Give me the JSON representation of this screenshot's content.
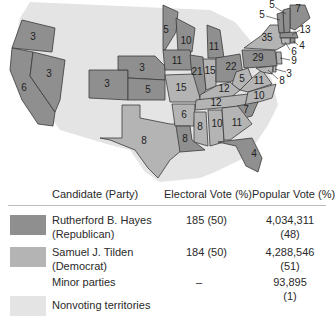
{
  "colors": {
    "republican": "#8f8f8f",
    "democrat": "#b4b4b4",
    "minor": "#ffffff",
    "nonvoting": "#e4e4e4",
    "border": "#3a3a3a"
  },
  "map": {
    "states": [
      {
        "id": "OR",
        "ev": "3",
        "party": "republican"
      },
      {
        "id": "CA",
        "ev": "6",
        "party": "republican"
      },
      {
        "id": "NV",
        "ev": "3",
        "party": "republican"
      },
      {
        "id": "CO",
        "ev": "3",
        "party": "republican"
      },
      {
        "id": "NE",
        "ev": "3",
        "party": "republican"
      },
      {
        "id": "KS",
        "ev": "5",
        "party": "republican"
      },
      {
        "id": "TX",
        "ev": "8",
        "party": "democrat"
      },
      {
        "id": "MN",
        "ev": "5",
        "party": "republican"
      },
      {
        "id": "WI",
        "ev": "10",
        "party": "republican"
      },
      {
        "id": "IA",
        "ev": "11",
        "party": "republican"
      },
      {
        "id": "MI",
        "ev": "11",
        "party": "republican"
      },
      {
        "id": "IL",
        "ev": "21",
        "party": "republican"
      },
      {
        "id": "IN",
        "ev": "15",
        "party": "democrat"
      },
      {
        "id": "OH",
        "ev": "22",
        "party": "republican"
      },
      {
        "id": "MO",
        "ev": "15",
        "party": "democrat"
      },
      {
        "id": "KY",
        "ev": "12",
        "party": "democrat"
      },
      {
        "id": "WV",
        "ev": "5",
        "party": "democrat"
      },
      {
        "id": "VA",
        "ev": "11",
        "party": "democrat"
      },
      {
        "id": "TN",
        "ev": "12",
        "party": "democrat"
      },
      {
        "id": "NC",
        "ev": "10",
        "party": "democrat"
      },
      {
        "id": "AR",
        "ev": "6",
        "party": "democrat"
      },
      {
        "id": "SC",
        "ev": "7",
        "party": "republican"
      },
      {
        "id": "LA",
        "ev": "8",
        "party": "republican"
      },
      {
        "id": "MS",
        "ev": "8",
        "party": "democrat"
      },
      {
        "id": "AL",
        "ev": "10",
        "party": "democrat"
      },
      {
        "id": "GA",
        "ev": "11",
        "party": "democrat"
      },
      {
        "id": "FL",
        "ev": "4",
        "party": "republican"
      },
      {
        "id": "PA",
        "ev": "29",
        "party": "republican"
      },
      {
        "id": "NY",
        "ev": "35",
        "party": "democrat"
      },
      {
        "id": "ME",
        "ev": "7",
        "party": "republican"
      },
      {
        "id": "NH",
        "ev": "5",
        "party": "republican"
      },
      {
        "id": "VT",
        "ev": "5",
        "party": "republican"
      },
      {
        "id": "MA",
        "ev": "13",
        "party": "republican"
      },
      {
        "id": "RI",
        "ev": "4",
        "party": "republican"
      },
      {
        "id": "CT",
        "ev": "6",
        "party": "democrat"
      },
      {
        "id": "NJ",
        "ev": "9",
        "party": "democrat"
      },
      {
        "id": "DE",
        "ev": "3",
        "party": "democrat"
      },
      {
        "id": "MD",
        "ev": "8",
        "party": "democrat"
      }
    ]
  },
  "legend": {
    "headers": {
      "candidate": "Candidate (Party)",
      "electoral": "Electoral Vote (%)",
      "popular": "Popular Vote (%)"
    },
    "rows": [
      {
        "name": "Rutherford B. Hayes",
        "party": "(Republican)",
        "electoral": "185 (50)",
        "popular": "4,034,311",
        "popular_pct": "(48)"
      },
      {
        "name": "Samuel J. Tilden",
        "party": "(Democrat)",
        "electoral": "184 (50)",
        "popular": "4,288,546",
        "popular_pct": "(51)"
      },
      {
        "name": "Minor parties",
        "party": "",
        "electoral": "–",
        "popular": "93,895",
        "popular_pct": "(1)"
      },
      {
        "name": "Nonvoting territories",
        "party": "",
        "electoral": "",
        "popular": "",
        "popular_pct": ""
      }
    ]
  }
}
